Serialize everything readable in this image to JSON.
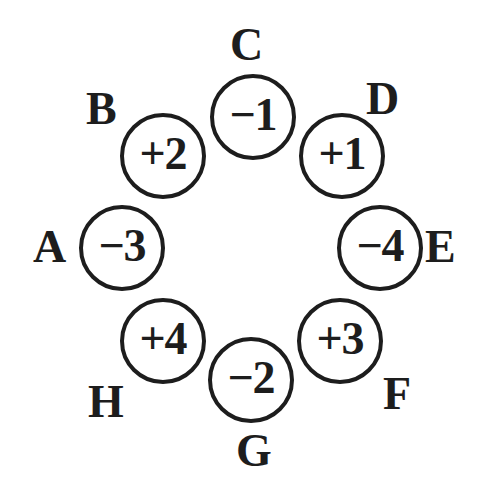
{
  "diagram": {
    "type": "circular-node-diagram",
    "background_color": "#ffffff",
    "stroke_color": "#1d1d1d",
    "text_color": "#1d1d1d",
    "node_count": 8,
    "node_radius_px": 43,
    "ring_center": {
      "x": 251,
      "y": 249
    },
    "nodes": [
      {
        "label": "A",
        "value": "−3",
        "sign": "minus",
        "magnitude": 3,
        "label_position": "left",
        "cx": 122,
        "cy": 248,
        "label_x": 33,
        "label_y": 224
      },
      {
        "label": "B",
        "value": "+2",
        "sign": "plus",
        "magnitude": 2,
        "label_position": "top-left",
        "cx": 163,
        "cy": 156,
        "label_x": 86,
        "label_y": 86
      },
      {
        "label": "C",
        "value": "−1",
        "sign": "minus",
        "magnitude": 1,
        "label_position": "top",
        "cx": 253,
        "cy": 117,
        "label_x": 230,
        "label_y": 22
      },
      {
        "label": "D",
        "value": "+1",
        "sign": "plus",
        "magnitude": 1,
        "label_position": "top-right",
        "cx": 342,
        "cy": 156,
        "label_x": 366,
        "label_y": 76
      },
      {
        "label": "E",
        "value": "−4",
        "sign": "minus",
        "magnitude": 4,
        "label_position": "right",
        "cx": 380,
        "cy": 248,
        "label_x": 425,
        "label_y": 224
      },
      {
        "label": "F",
        "value": "+3",
        "sign": "plus",
        "magnitude": 3,
        "label_position": "bottom-right",
        "cx": 340,
        "cy": 341,
        "label_x": 383,
        "label_y": 371
      },
      {
        "label": "G",
        "value": "−2",
        "sign": "minus",
        "magnitude": 2,
        "label_position": "bottom",
        "cx": 251,
        "cy": 380,
        "label_x": 236,
        "label_y": 428
      },
      {
        "label": "H",
        "value": "+4",
        "sign": "plus",
        "magnitude": 4,
        "label_position": "bottom-left",
        "cx": 163,
        "cy": 341,
        "label_x": 88,
        "label_y": 379
      }
    ]
  }
}
